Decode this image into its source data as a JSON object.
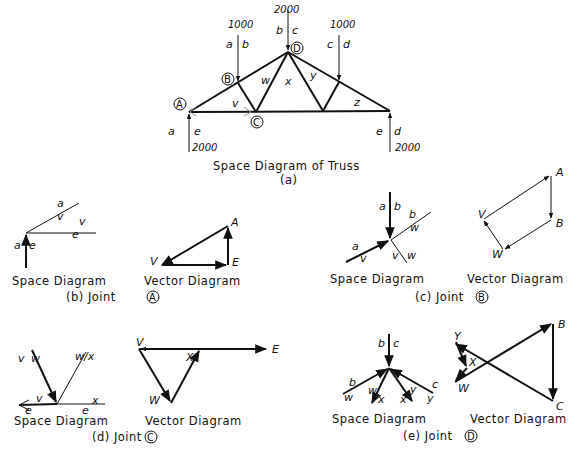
{
  "figure": {
    "main": {
      "caption": "Space Diagram of Truss",
      "sublabel": "(a)",
      "loads": {
        "left_top": "1000",
        "apex": "2000",
        "right_top": "1000"
      },
      "reactions": {
        "left": "2000",
        "right": "2000"
      },
      "joints": {
        "A": "A",
        "B": "B",
        "C": "C",
        "D": "D"
      },
      "space_labels": {
        "a": "a",
        "b": "b",
        "c": "c",
        "d": "d",
        "e": "e",
        "v": "v",
        "w": "w",
        "x": "x",
        "y": "y",
        "z": "z"
      }
    },
    "panel_b": {
      "caption": "(b) Joint",
      "joint": "A",
      "space_caption": "Space Diagram",
      "vector_caption": "Vector Diagram",
      "space_labels": [
        "a",
        "v",
        "v",
        "e",
        "a",
        "e"
      ],
      "vector_labels": {
        "A": "A",
        "E": "E",
        "V": "V"
      }
    },
    "panel_c": {
      "caption": "(c) Joint",
      "joint": "B",
      "space_caption": "Space Diagram",
      "vector_caption": "Vector Diagram",
      "space_labels": [
        "a",
        "b",
        "b",
        "w",
        "a",
        "v",
        "v",
        "w"
      ],
      "vector_labels": {
        "A": "A",
        "B": "B",
        "V": "V",
        "W": "W"
      }
    },
    "panel_d": {
      "caption": "(d) Joint",
      "joint": "C",
      "space_caption": "Space Diagram",
      "vector_caption": "Vector Diagram",
      "space_labels": [
        "v",
        "w",
        "w/x",
        "v",
        "e",
        "e",
        "x"
      ],
      "vector_labels": {
        "V": "V",
        "E": "E",
        "X": "X",
        "W": "W"
      }
    },
    "panel_e": {
      "caption": "(e) Joint",
      "joint": "D",
      "space_caption": "Space Diagram",
      "vector_caption": "Vector Diagram",
      "space_labels": [
        "b",
        "c",
        "b",
        "w",
        "w",
        "x",
        "x",
        "y",
        "c",
        "y"
      ],
      "vector_labels": {
        "Y": "Y",
        "X": "X",
        "W": "W",
        "B": "B",
        "C": "C"
      }
    }
  }
}
